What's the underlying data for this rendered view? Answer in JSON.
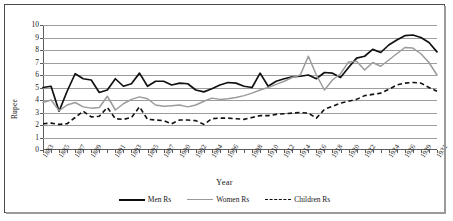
{
  "chart_data": {
    "type": "line",
    "title": "",
    "xlabel": "Year",
    "ylabel": "Rupee",
    "ylim": [
      0,
      10
    ],
    "yticks": [
      0,
      1,
      2,
      3,
      4,
      5,
      6,
      7,
      8,
      9,
      10
    ],
    "grid": true,
    "legend_position": "bottom",
    "x": [
      1883,
      1884,
      1885,
      1886,
      1887,
      1888,
      1889,
      1890,
      1891,
      1892,
      1893,
      1894,
      1895,
      1896,
      1897,
      1898,
      1899,
      1900,
      1901,
      1902,
      1903,
      1904,
      1905,
      1906,
      1907,
      1908,
      1909,
      1910,
      1911,
      1912,
      1913,
      1914,
      1915,
      1916,
      1917,
      1918,
      1919,
      1920,
      1921,
      1922,
      1923,
      1924,
      1925,
      1926,
      1927,
      1928,
      1929,
      1930,
      1931,
      1932
    ],
    "tick_labels": [
      "1883",
      "1885",
      "1887",
      "1889",
      "1891",
      "1893",
      "1895",
      "1897",
      "1900",
      "1902",
      "1904",
      "1906",
      "1908",
      "1910",
      "1912",
      "1914",
      "1916",
      "1918",
      "1920",
      "1922",
      "1924",
      "1926",
      "1929",
      "1931"
    ],
    "series": [
      {
        "name": "Men Rs",
        "color": "#111111",
        "style": "solid",
        "values": [
          5.0,
          5.1,
          3.1,
          4.7,
          6.1,
          5.7,
          5.6,
          4.6,
          4.8,
          5.7,
          5.1,
          5.3,
          6.15,
          5.1,
          5.5,
          5.5,
          5.2,
          5.35,
          5.3,
          4.8,
          4.65,
          4.9,
          5.2,
          5.4,
          5.35,
          5.1,
          5.0,
          6.15,
          5.1,
          5.5,
          5.7,
          5.85,
          5.9,
          6.0,
          5.7,
          6.2,
          6.15,
          5.8,
          6.6,
          7.35,
          7.5,
          8.05,
          7.8,
          8.4,
          8.8,
          9.15,
          9.2,
          9.0,
          8.6,
          7.85
        ]
      },
      {
        "name": "Women Rs",
        "color": "#9b9b9b",
        "style": "solid",
        "values": [
          3.8,
          4.0,
          3.15,
          3.6,
          3.8,
          3.45,
          3.35,
          3.4,
          4.3,
          3.2,
          3.7,
          4.05,
          4.25,
          4.1,
          3.6,
          3.5,
          3.55,
          3.6,
          3.45,
          3.6,
          3.9,
          4.15,
          4.05,
          4.1,
          4.2,
          4.35,
          4.55,
          4.8,
          5.0,
          5.25,
          5.5,
          5.8,
          6.0,
          7.5,
          6.0,
          4.8,
          5.6,
          6.1,
          7.05,
          7.1,
          6.4,
          7.0,
          6.7,
          7.2,
          7.7,
          8.2,
          8.15,
          7.7,
          7.0,
          6.0
        ]
      },
      {
        "name": "Children Rs",
        "color": "#111111",
        "style": "dashed",
        "values": [
          2.1,
          2.15,
          2.05,
          2.1,
          2.6,
          3.1,
          2.65,
          2.7,
          3.4,
          2.5,
          2.45,
          2.6,
          3.45,
          2.45,
          2.4,
          2.35,
          2.1,
          2.4,
          2.4,
          2.35,
          2.05,
          2.5,
          2.55,
          2.55,
          2.5,
          2.45,
          2.6,
          2.75,
          2.75,
          2.85,
          2.9,
          2.95,
          3.0,
          2.95,
          2.55,
          3.25,
          3.5,
          3.75,
          3.9,
          4.05,
          4.35,
          4.45,
          4.55,
          4.85,
          5.2,
          5.35,
          5.4,
          5.35,
          5.0,
          4.7
        ]
      }
    ]
  },
  "axes": {
    "y_title": "Rupee",
    "x_title": "Year"
  },
  "legend": {
    "items": [
      {
        "label": "Men Rs"
      },
      {
        "label": "Women Rs"
      },
      {
        "label": "Children Rs"
      }
    ]
  }
}
